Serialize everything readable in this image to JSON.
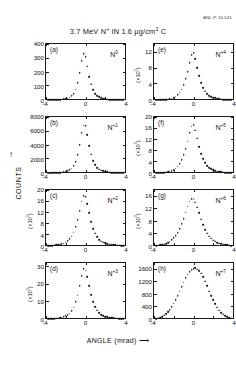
{
  "figure": {
    "anl_code": "ANL-P-16,541",
    "title_prefix": "3.7 MeV N",
    "title_sup": "+",
    "title_mid": " IN 1.6 µg/cm",
    "title_sup2": "2",
    "title_suffix": " C",
    "x_axis_title": "ANGLE  (mrad)  ⟶",
    "y_axis_title": "COUNTS",
    "y_axis_arrow": "↑"
  },
  "chart_data": [
    {
      "type": "scatter",
      "panel": "a",
      "series_label": "N",
      "charge_state": "0",
      "title": "",
      "xlabel": "ANGLE (mrad)",
      "ylabel": "COUNTS",
      "xlim": [
        -4,
        4
      ],
      "ylim": [
        0,
        400
      ],
      "yticks": [
        0,
        100,
        200,
        300,
        400
      ],
      "ytick_labels": [
        "0",
        "100",
        "200",
        "300",
        "400"
      ],
      "y_multiplier": "",
      "xticks": [
        -4,
        0,
        4
      ],
      "xtick_labels": [
        "-4",
        "0",
        "4"
      ],
      "grid": false,
      "x": [
        -3.8,
        -3.6,
        -3.4,
        -3.2,
        -3.0,
        -2.8,
        -2.6,
        -2.4,
        -2.2,
        -2.0,
        -1.8,
        -1.6,
        -1.4,
        -1.2,
        -1.0,
        -0.8,
        -0.6,
        -0.4,
        -0.2,
        0.0,
        0.2,
        0.4,
        0.6,
        0.8,
        1.0,
        1.2,
        1.4,
        1.6,
        1.8,
        2.0,
        2.2,
        2.4,
        2.6,
        2.8,
        3.0,
        3.2,
        3.4,
        3.6,
        3.8
      ],
      "y": [
        4,
        4,
        5,
        5,
        6,
        7,
        8,
        9,
        11,
        14,
        18,
        24,
        35,
        52,
        82,
        130,
        205,
        290,
        340,
        318,
        250,
        175,
        118,
        78,
        52,
        36,
        26,
        19,
        14,
        11,
        9,
        8,
        7,
        6,
        5,
        5,
        4,
        4,
        4
      ]
    },
    {
      "type": "scatter",
      "panel": "b",
      "series_label": "N",
      "charge_state": "+1",
      "xlim": [
        -4,
        4
      ],
      "ylim": [
        0,
        8000
      ],
      "yticks": [
        0,
        2000,
        4000,
        6000,
        8000
      ],
      "ytick_labels": [
        "0",
        "2000",
        "4000",
        "6000",
        "8000"
      ],
      "y_multiplier": "",
      "xticks": [
        -4,
        0,
        4
      ],
      "xtick_labels": [
        "-4",
        "0",
        "4"
      ],
      "grid": false,
      "x": [
        -3.8,
        -3.6,
        -3.4,
        -3.2,
        -3.0,
        -2.8,
        -2.6,
        -2.4,
        -2.2,
        -2.0,
        -1.8,
        -1.6,
        -1.4,
        -1.2,
        -1.0,
        -0.8,
        -0.6,
        -0.4,
        -0.2,
        0.0,
        0.2,
        0.4,
        0.6,
        0.8,
        1.0,
        1.2,
        1.4,
        1.6,
        1.8,
        2.0,
        2.2,
        2.4,
        2.6,
        2.8,
        3.0,
        3.2,
        3.4,
        3.6,
        3.8
      ],
      "y": [
        60,
        70,
        80,
        95,
        110,
        135,
        165,
        200,
        250,
        320,
        420,
        560,
        780,
        1150,
        1750,
        2700,
        4150,
        5900,
        7050,
        6950,
        5700,
        4100,
        2800,
        1900,
        1300,
        900,
        650,
        480,
        370,
        295,
        240,
        200,
        170,
        145,
        125,
        110,
        95,
        85,
        75
      ]
    },
    {
      "type": "scatter",
      "panel": "c",
      "series_label": "N",
      "charge_state": "+2",
      "xlim": [
        -4,
        4
      ],
      "ylim": [
        0,
        20
      ],
      "yticks": [
        0,
        4,
        8,
        12,
        16,
        20
      ],
      "ytick_labels": [
        "0",
        "4",
        "8",
        "12",
        "16",
        "20"
      ],
      "y_multiplier": "(×10³)",
      "xticks": [
        -4,
        0,
        4
      ],
      "xtick_labels": [
        "-4",
        "0",
        "4"
      ],
      "grid": false,
      "x": [
        -3.8,
        -3.6,
        -3.4,
        -3.2,
        -3.0,
        -2.8,
        -2.6,
        -2.4,
        -2.2,
        -2.0,
        -1.8,
        -1.6,
        -1.4,
        -1.2,
        -1.0,
        -0.8,
        -0.6,
        -0.4,
        -0.2,
        0.0,
        0.2,
        0.4,
        0.6,
        0.8,
        1.0,
        1.2,
        1.4,
        1.6,
        1.8,
        2.0,
        2.2,
        2.4,
        2.6,
        2.8,
        3.0,
        3.2,
        3.4,
        3.6,
        3.8
      ],
      "y": [
        0.3,
        0.35,
        0.4,
        0.45,
        0.55,
        0.65,
        0.8,
        1.0,
        1.25,
        1.6,
        2.1,
        2.8,
        3.8,
        5.2,
        7.2,
        9.8,
        13.0,
        16.5,
        18.6,
        18.2,
        15.6,
        12.2,
        9.0,
        6.6,
        4.8,
        3.5,
        2.6,
        2.0,
        1.6,
        1.3,
        1.1,
        0.9,
        0.8,
        0.7,
        0.6,
        0.5,
        0.45,
        0.4,
        0.35
      ]
    },
    {
      "type": "scatter",
      "panel": "d",
      "series_label": "N",
      "charge_state": "+3",
      "xlim": [
        -4,
        4
      ],
      "ylim": [
        0,
        32
      ],
      "yticks": [
        0,
        10,
        20,
        30
      ],
      "ytick_labels": [
        "0",
        "10",
        "20",
        "30"
      ],
      "y_multiplier": "(×10³)",
      "xticks": [
        -4,
        0,
        4
      ],
      "xtick_labels": [
        "-4",
        "0",
        "4"
      ],
      "grid": false,
      "x": [
        -3.8,
        -3.6,
        -3.4,
        -3.2,
        -3.0,
        -2.8,
        -2.6,
        -2.4,
        -2.2,
        -2.0,
        -1.8,
        -1.6,
        -1.4,
        -1.2,
        -1.0,
        -0.8,
        -0.6,
        -0.4,
        -0.2,
        0.0,
        0.2,
        0.4,
        0.6,
        0.8,
        1.0,
        1.2,
        1.4,
        1.6,
        1.8,
        2.0,
        2.2,
        2.4,
        2.6,
        2.8,
        3.0,
        3.2,
        3.4,
        3.6,
        3.8
      ],
      "y": [
        0.4,
        0.45,
        0.5,
        0.6,
        0.7,
        0.85,
        1.05,
        1.3,
        1.65,
        2.1,
        2.8,
        3.7,
        5.1,
        7.2,
        10.2,
        14.2,
        19.5,
        25.5,
        29.4,
        28.8,
        24.8,
        19.5,
        14.5,
        10.5,
        7.5,
        5.4,
        4.0,
        3.0,
        2.3,
        1.85,
        1.5,
        1.25,
        1.05,
        0.9,
        0.8,
        0.7,
        0.6,
        0.55,
        0.5
      ]
    },
    {
      "type": "scatter",
      "panel": "e",
      "series_label": "N",
      "charge_state": "+4",
      "xlim": [
        -4,
        4
      ],
      "ylim": [
        0,
        14
      ],
      "yticks": [
        0,
        4,
        8,
        12
      ],
      "ytick_labels": [
        "0",
        "4",
        "8",
        "12"
      ],
      "y_multiplier": "(×10³)",
      "xticks": [
        -4,
        0,
        4
      ],
      "xtick_labels": [
        "-4",
        "0",
        "4"
      ],
      "grid": false,
      "x": [
        -3.8,
        -3.6,
        -3.4,
        -3.2,
        -3.0,
        -2.8,
        -2.6,
        -2.4,
        -2.2,
        -2.0,
        -1.8,
        -1.6,
        -1.4,
        -1.2,
        -1.0,
        -0.8,
        -0.6,
        -0.4,
        -0.2,
        0.0,
        0.2,
        0.4,
        0.6,
        0.8,
        1.0,
        1.2,
        1.4,
        1.6,
        1.8,
        2.0,
        2.2,
        2.4,
        2.6,
        2.8,
        3.0,
        3.2,
        3.4,
        3.6,
        3.8
      ],
      "y": [
        0.1,
        0.12,
        0.15,
        0.18,
        0.22,
        0.28,
        0.35,
        0.45,
        0.6,
        0.8,
        1.1,
        1.5,
        2.1,
        2.9,
        4.0,
        5.5,
        7.4,
        9.6,
        11.6,
        12.1,
        10.6,
        8.4,
        6.3,
        4.6,
        3.3,
        2.4,
        1.75,
        1.3,
        1.0,
        0.8,
        0.65,
        0.52,
        0.42,
        0.35,
        0.3,
        0.25,
        0.2,
        0.17,
        0.15
      ]
    },
    {
      "type": "scatter",
      "panel": "f",
      "series_label": "N",
      "charge_state": "+5",
      "xlim": [
        -4,
        4
      ],
      "ylim": [
        0,
        20
      ],
      "yticks": [
        0,
        4,
        8,
        12,
        16,
        20
      ],
      "ytick_labels": [
        "0",
        "4",
        "8",
        "12",
        "16",
        "20"
      ],
      "y_multiplier": "(×10³)",
      "xticks": [
        -4,
        0,
        4
      ],
      "xtick_labels": [
        "-4",
        "0",
        "4"
      ],
      "grid": false,
      "x": [
        -3.8,
        -3.6,
        -3.4,
        -3.2,
        -3.0,
        -2.8,
        -2.6,
        -2.4,
        -2.2,
        -2.0,
        -1.8,
        -1.6,
        -1.4,
        -1.2,
        -1.0,
        -0.8,
        -0.6,
        -0.4,
        -0.2,
        0.0,
        0.2,
        0.4,
        0.6,
        0.8,
        1.0,
        1.2,
        1.4,
        1.6,
        1.8,
        2.0,
        2.2,
        2.4,
        2.6,
        2.8,
        3.0,
        3.2,
        3.4,
        3.6,
        3.8
      ],
      "y": [
        0.15,
        0.2,
        0.25,
        0.3,
        0.4,
        0.5,
        0.65,
        0.85,
        1.1,
        1.5,
        2.0,
        2.7,
        3.7,
        5.0,
        6.8,
        9.0,
        11.8,
        14.8,
        17.2,
        17.8,
        15.8,
        12.8,
        9.8,
        7.2,
        5.3,
        3.9,
        2.9,
        2.2,
        1.7,
        1.35,
        1.1,
        0.9,
        0.75,
        0.6,
        0.5,
        0.42,
        0.35,
        0.3,
        0.25
      ]
    },
    {
      "type": "scatter",
      "panel": "g",
      "series_label": "N",
      "charge_state": "+6",
      "xlim": [
        -4,
        4
      ],
      "ylim": [
        0,
        18
      ],
      "yticks": [
        0,
        4,
        8,
        12,
        16
      ],
      "ytick_labels": [
        "0",
        "4",
        "8",
        "12",
        "16"
      ],
      "y_multiplier": "(×10³)",
      "xticks": [
        -4,
        0,
        4
      ],
      "xtick_labels": [
        "-4",
        "0",
        "4"
      ],
      "grid": false,
      "x": [
        -3.8,
        -3.6,
        -3.4,
        -3.2,
        -3.0,
        -2.8,
        -2.6,
        -2.4,
        -2.2,
        -2.0,
        -1.8,
        -1.6,
        -1.4,
        -1.2,
        -1.0,
        -0.8,
        -0.6,
        -0.4,
        -0.2,
        0.0,
        0.2,
        0.4,
        0.6,
        0.8,
        1.0,
        1.2,
        1.4,
        1.6,
        1.8,
        2.0,
        2.2,
        2.4,
        2.6,
        2.8,
        3.0,
        3.2,
        3.4,
        3.6,
        3.8
      ],
      "y": [
        0.3,
        0.4,
        0.5,
        0.65,
        0.8,
        1.0,
        1.3,
        1.7,
        2.2,
        2.8,
        3.6,
        4.6,
        5.9,
        7.4,
        9.2,
        11.2,
        13.2,
        14.8,
        15.6,
        15.5,
        14.5,
        12.9,
        11.0,
        9.0,
        7.2,
        5.6,
        4.4,
        3.4,
        2.7,
        2.1,
        1.7,
        1.35,
        1.1,
        0.9,
        0.75,
        0.6,
        0.5,
        0.42,
        0.35
      ]
    },
    {
      "type": "scatter",
      "panel": "h",
      "series_label": "N",
      "charge_state": "+7",
      "xlim": [
        -4,
        4
      ],
      "ylim": [
        0,
        1800
      ],
      "yticks": [
        0,
        400,
        800,
        1200,
        1600
      ],
      "ytick_labels": [
        "0",
        "400",
        "800",
        "1200",
        "1600"
      ],
      "y_multiplier": "",
      "xticks": [
        -4,
        0,
        4
      ],
      "xtick_labels": [
        "-4",
        "0",
        "4"
      ],
      "grid": false,
      "x": [
        -3.8,
        -3.6,
        -3.4,
        -3.2,
        -3.0,
        -2.8,
        -2.6,
        -2.4,
        -2.2,
        -2.0,
        -1.8,
        -1.6,
        -1.4,
        -1.2,
        -1.0,
        -0.8,
        -0.6,
        -0.4,
        -0.2,
        0.0,
        0.2,
        0.4,
        0.6,
        0.8,
        1.0,
        1.2,
        1.4,
        1.6,
        1.8,
        2.0,
        2.2,
        2.4,
        2.6,
        2.8,
        3.0,
        3.2,
        3.4,
        3.6,
        3.8
      ],
      "y": [
        25,
        45,
        70,
        100,
        140,
        190,
        250,
        330,
        420,
        530,
        650,
        790,
        930,
        1080,
        1220,
        1360,
        1480,
        1570,
        1640,
        1660,
        1690,
        1650,
        1600,
        1520,
        1400,
        1260,
        1100,
        930,
        780,
        640,
        510,
        400,
        310,
        235,
        175,
        130,
        95,
        65,
        40
      ]
    }
  ]
}
